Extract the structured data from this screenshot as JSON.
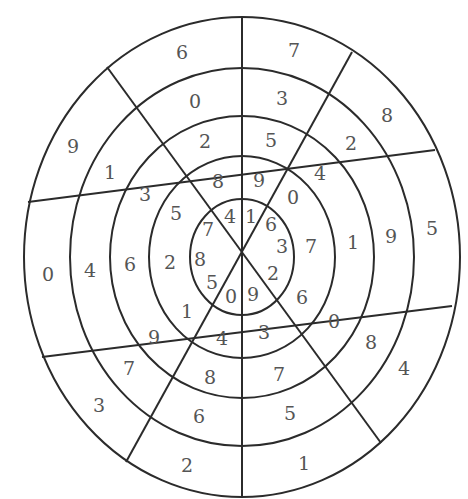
{
  "diagram": {
    "type": "concentric-number-wheel",
    "center": [
      242,
      257
    ],
    "rings": [
      {
        "rx": 52,
        "ry": 58
      },
      {
        "rx": 93,
        "ry": 101
      },
      {
        "rx": 132,
        "ry": 141
      },
      {
        "rx": 172,
        "ry": 189
      },
      {
        "rx": 218,
        "ry": 240
      }
    ],
    "spokes": [
      {
        "x1": 242,
        "y1": 16,
        "x2": 242,
        "y2": 496
      },
      {
        "x1": 107,
        "y1": 67,
        "x2": 381,
        "y2": 443
      },
      {
        "x1": 352,
        "y1": 52,
        "x2": 126,
        "y2": 462
      },
      {
        "x1": 435,
        "y1": 150,
        "x2": 28,
        "y2": 202
      },
      {
        "x1": 42,
        "y1": 357,
        "x2": 452,
        "y2": 306
      }
    ],
    "sectors": [
      {
        "name": "top-right",
        "digits_inner_to_outer": [
          "1",
          "9",
          "5",
          "3",
          "7"
        ]
      },
      {
        "name": "upper-right",
        "digits_inner_to_outer": [
          "6",
          "0",
          "4",
          "2",
          "8"
        ]
      },
      {
        "name": "right",
        "digits_inner_to_outer": [
          "3",
          "7",
          "1",
          "9",
          "5"
        ]
      },
      {
        "name": "lower-right",
        "digits_inner_to_outer": [
          "2",
          "6",
          "0",
          "8",
          "4"
        ]
      },
      {
        "name": "bottom-right",
        "digits_inner_to_outer": [
          "9",
          "3",
          "7",
          "5",
          "1"
        ]
      },
      {
        "name": "bottom-left",
        "digits_inner_to_outer": [
          "0",
          "4",
          "8",
          "6",
          "2"
        ]
      },
      {
        "name": "lower-left",
        "digits_inner_to_outer": [
          "5",
          "1",
          "9",
          "7",
          "3"
        ]
      },
      {
        "name": "left",
        "digits_inner_to_outer": [
          "8",
          "2",
          "6",
          "4",
          "0"
        ]
      },
      {
        "name": "upper-left",
        "digits_inner_to_outer": [
          "7",
          "5",
          "3",
          "1",
          "9"
        ]
      },
      {
        "name": "top-left",
        "digits_inner_to_outer": [
          "4",
          "8",
          "2",
          "0",
          "6"
        ]
      }
    ],
    "labels": [
      {
        "t": "1",
        "x": 251,
        "y": 216
      },
      {
        "t": "9",
        "x": 259,
        "y": 180
      },
      {
        "t": "5",
        "x": 271,
        "y": 140
      },
      {
        "t": "3",
        "x": 282,
        "y": 98
      },
      {
        "t": "7",
        "x": 294,
        "y": 50
      },
      {
        "t": "6",
        "x": 271,
        "y": 224
      },
      {
        "t": "0",
        "x": 293,
        "y": 197
      },
      {
        "t": "4",
        "x": 320,
        "y": 173
      },
      {
        "t": "2",
        "x": 351,
        "y": 143
      },
      {
        "t": "8",
        "x": 387,
        "y": 115
      },
      {
        "t": "3",
        "x": 282,
        "y": 246
      },
      {
        "t": "7",
        "x": 311,
        "y": 246
      },
      {
        "t": "1",
        "x": 353,
        "y": 242
      },
      {
        "t": "9",
        "x": 391,
        "y": 236
      },
      {
        "t": "5",
        "x": 432,
        "y": 228
      },
      {
        "t": "2",
        "x": 273,
        "y": 273
      },
      {
        "t": "6",
        "x": 302,
        "y": 297
      },
      {
        "t": "0",
        "x": 334,
        "y": 321
      },
      {
        "t": "8",
        "x": 371,
        "y": 342
      },
      {
        "t": "4",
        "x": 404,
        "y": 368
      },
      {
        "t": "9",
        "x": 253,
        "y": 294
      },
      {
        "t": "3",
        "x": 264,
        "y": 332
      },
      {
        "t": "7",
        "x": 279,
        "y": 374
      },
      {
        "t": "5",
        "x": 290,
        "y": 413
      },
      {
        "t": "1",
        "x": 304,
        "y": 463
      },
      {
        "t": "0",
        "x": 231,
        "y": 296
      },
      {
        "t": "4",
        "x": 222,
        "y": 338
      },
      {
        "t": "8",
        "x": 210,
        "y": 377
      },
      {
        "t": "6",
        "x": 199,
        "y": 416
      },
      {
        "t": "2",
        "x": 187,
        "y": 465
      },
      {
        "t": "5",
        "x": 212,
        "y": 282
      },
      {
        "t": "1",
        "x": 187,
        "y": 311
      },
      {
        "t": "9",
        "x": 154,
        "y": 337
      },
      {
        "t": "7",
        "x": 129,
        "y": 368
      },
      {
        "t": "3",
        "x": 99,
        "y": 405
      },
      {
        "t": "8",
        "x": 200,
        "y": 259
      },
      {
        "t": "2",
        "x": 170,
        "y": 262
      },
      {
        "t": "6",
        "x": 130,
        "y": 264
      },
      {
        "t": "4",
        "x": 90,
        "y": 270
      },
      {
        "t": "0",
        "x": 48,
        "y": 274
      },
      {
        "t": "7",
        "x": 208,
        "y": 229
      },
      {
        "t": "5",
        "x": 176,
        "y": 213
      },
      {
        "t": "3",
        "x": 145,
        "y": 194
      },
      {
        "t": "1",
        "x": 110,
        "y": 172
      },
      {
        "t": "9",
        "x": 73,
        "y": 146
      },
      {
        "t": "4",
        "x": 230,
        "y": 216
      },
      {
        "t": "8",
        "x": 218,
        "y": 181
      },
      {
        "t": "2",
        "x": 205,
        "y": 141
      },
      {
        "t": "0",
        "x": 195,
        "y": 101
      },
      {
        "t": "6",
        "x": 182,
        "y": 52
      }
    ]
  }
}
